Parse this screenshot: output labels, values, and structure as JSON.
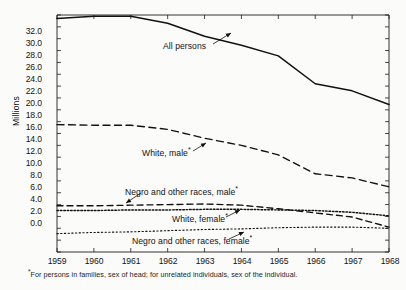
{
  "chart_data": {
    "type": "line",
    "title": "",
    "xlabel": "",
    "ylabel": "Millions",
    "xlim": [
      1959,
      1968
    ],
    "ylim": [
      0.0,
      40.0
    ],
    "ytick_step": 2.0,
    "grid": false,
    "legend_position": "inline-annotations",
    "x": [
      1959,
      1960,
      1961,
      1962,
      1963,
      1964,
      1965,
      1966,
      1967,
      1968
    ],
    "xtick_labels": [
      "1959",
      "1960",
      "1961",
      "1962",
      "1963",
      "1964",
      "1965",
      "1966",
      "1967",
      "1968"
    ],
    "ytick_labels": [
      "0.0",
      "2.0",
      "4.0",
      "6.0",
      "8.0",
      "10.0",
      "12.0",
      "14.0",
      "16.0",
      "18.0",
      "20.0",
      "22.0",
      "24.0",
      "26.0",
      "28.0",
      "30.0",
      "32.0",
      "34.0",
      "36.0",
      "38.0",
      "40.0"
    ],
    "series": [
      {
        "name": "All persons",
        "label": "All persons",
        "style": "solid",
        "values": [
          39.4,
          39.8,
          39.8,
          38.6,
          36.4,
          34.9,
          33.1,
          28.4,
          27.2,
          24.9
        ]
      },
      {
        "name": "White, male",
        "label": "White, male",
        "footnote_marker": "*",
        "style": "dashed-long",
        "values": [
          21.5,
          21.4,
          21.4,
          20.7,
          19.2,
          18.0,
          16.4,
          13.2,
          12.5,
          11.0
        ]
      },
      {
        "name": "Negro and other races, male",
        "label": "Negro and other races, male",
        "footnote_marker": "*",
        "style": "dashed-medium",
        "values": [
          7.8,
          7.8,
          7.9,
          8.0,
          8.1,
          7.9,
          7.3,
          6.6,
          5.9,
          4.2
        ]
      },
      {
        "name": "White, female",
        "label": "White, female",
        "footnote_marker": "*",
        "style": "dotted",
        "values": [
          7.0,
          7.0,
          7.1,
          7.1,
          7.2,
          7.2,
          7.1,
          7.0,
          6.7,
          6.1
        ]
      },
      {
        "name": "Negro and other races, female",
        "label": "Negro and other races, female",
        "footnote_marker": "*",
        "style": "dotted-fine",
        "values": [
          3.1,
          3.3,
          3.4,
          3.6,
          3.8,
          3.9,
          4.1,
          4.2,
          4.2,
          4.0
        ]
      }
    ],
    "annotations": [
      {
        "text": "All persons",
        "marker": "",
        "x_pos": 1962.3,
        "y_pos": 35.2
      },
      {
        "text": "White, male",
        "marker": "*",
        "x_pos": 1962.2,
        "y_pos": 16.0
      },
      {
        "text": "Negro and other races, male",
        "marker": "*",
        "x_pos": 1961.0,
        "y_pos": 9.6
      },
      {
        "text": "White, female",
        "marker": "*",
        "x_pos": 1963.0,
        "y_pos": 5.6
      },
      {
        "text": "Negro and other races, female",
        "marker": "*",
        "x_pos": 1961.3,
        "y_pos": 2.3
      }
    ],
    "footnote": "For persons in families, sex of head; for unrelated individuals, sex of the individual.",
    "footnote_marker": "*"
  },
  "colors": {
    "line": "#111111",
    "axis": "#1b1b1b",
    "background": "#fbfbfa",
    "text": "#141414"
  }
}
